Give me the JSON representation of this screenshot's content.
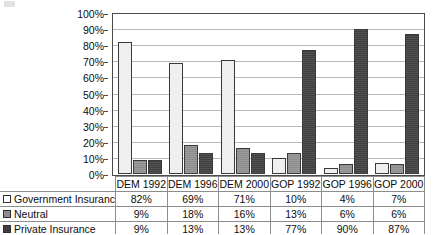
{
  "chart_data": {
    "type": "bar",
    "title": "",
    "subtitle": "",
    "xlabel": "",
    "ylabel": "",
    "categories": [
      "DEM 1992",
      "DEM 1996",
      "DEM 2000",
      "GOP 1992",
      "GOP 1996",
      "GOP 2000"
    ],
    "series": [
      {
        "name": "Government Insurance",
        "values": [
          82,
          69,
          71,
          10,
          4,
          7
        ],
        "color": "#efefef"
      },
      {
        "name": "Neutral",
        "values": [
          9,
          18,
          16,
          13,
          6,
          6
        ],
        "color": "#8c8c8c"
      },
      {
        "name": "Private Insurance",
        "values": [
          9,
          13,
          13,
          77,
          90,
          87
        ],
        "color": "#3f3f3f"
      }
    ],
    "value_suffix": "%",
    "ylim": [
      0,
      100
    ],
    "ytick_step": 10,
    "ytick_labels": [
      "100%",
      "90%",
      "80%",
      "70%",
      "60%",
      "50%",
      "40%",
      "30%",
      "20%",
      "10%",
      "0%"
    ],
    "grid": "horizontal",
    "legend_position": "table-row-labels",
    "data_table_visible": true
  },
  "table": {
    "header_cells": [
      "",
      "DEM 1992",
      "DEM 1996",
      "DEM 2000",
      "GOP 1992",
      "GOP 1996",
      "GOP 2000"
    ],
    "rows": [
      {
        "label": "Government Insurance",
        "swatch": "legend-swatch-government-insurance",
        "cells": [
          "82%",
          "69%",
          "71%",
          "10%",
          "4%",
          "7%"
        ]
      },
      {
        "label": "Neutral",
        "swatch": "legend-swatch-neutral",
        "cells": [
          "9%",
          "18%",
          "16%",
          "13%",
          "6%",
          "6%"
        ]
      },
      {
        "label": "Private Insurance",
        "swatch": "legend-swatch-private-insurance",
        "cells": [
          "9%",
          "13%",
          "13%",
          "77%",
          "90%",
          "87%"
        ]
      }
    ]
  }
}
